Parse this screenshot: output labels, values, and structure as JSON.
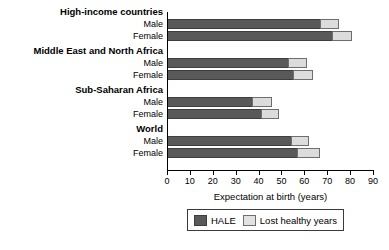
{
  "chart_data": {
    "type": "bar",
    "orientation": "horizontal",
    "stacked": true,
    "title": "",
    "xlabel": "Expectation at birth (years)",
    "ylabel": "",
    "xlim": [
      0,
      90
    ],
    "xticks": [
      0,
      10,
      20,
      30,
      40,
      50,
      60,
      70,
      80,
      90
    ],
    "xtick_labels": [
      "0",
      "10",
      "20",
      "30",
      "40",
      "50",
      "60",
      "70",
      "80",
      "90"
    ],
    "grid": false,
    "legend_position": "bottom",
    "series": [
      {
        "name": "HALE",
        "color": "#595959",
        "values": [
          67,
          72,
          53,
          55,
          37,
          41,
          54,
          57
        ]
      },
      {
        "name": "Lost healthy years",
        "color": "#dcdcdc",
        "values": [
          8,
          9,
          8,
          9,
          9,
          8,
          8,
          10
        ]
      }
    ],
    "categories": [
      "High-income countries Male",
      "High-income countries Female",
      "Middle East and North Africa Male",
      "Middle East and North Africa Female",
      "Sub-Saharan Africa Male",
      "Sub-Saharan Africa Female",
      "World Male",
      "World Female"
    ],
    "groups": [
      {
        "label": "High-income countries",
        "rows": [
          {
            "label": "Male",
            "hale": 67,
            "lost": 8,
            "total": 75
          },
          {
            "label": "Female",
            "hale": 72,
            "lost": 9,
            "total": 81
          }
        ]
      },
      {
        "label": "Middle East and North Africa",
        "rows": [
          {
            "label": "Male",
            "hale": 53,
            "lost": 8,
            "total": 61
          },
          {
            "label": "Female",
            "hale": 55,
            "lost": 9,
            "total": 64
          }
        ]
      },
      {
        "label": "Sub-Saharan Africa",
        "rows": [
          {
            "label": "Male",
            "hale": 37,
            "lost": 9,
            "total": 46
          },
          {
            "label": "Female",
            "hale": 41,
            "lost": 8,
            "total": 49
          }
        ]
      },
      {
        "label": "World",
        "rows": [
          {
            "label": "Male",
            "hale": 54,
            "lost": 8,
            "total": 62
          },
          {
            "label": "Female",
            "hale": 57,
            "lost": 10,
            "total": 67
          }
        ]
      }
    ]
  },
  "axis": {
    "x_title": "Expectation at birth (years)",
    "ticks": [
      "0",
      "10",
      "20",
      "30",
      "40",
      "50",
      "60",
      "70",
      "80",
      "90"
    ]
  },
  "legend": {
    "items": [
      {
        "label": "HALE",
        "color": "#595959"
      },
      {
        "label": "Lost healthy years",
        "color": "#dcdcdc"
      }
    ]
  }
}
